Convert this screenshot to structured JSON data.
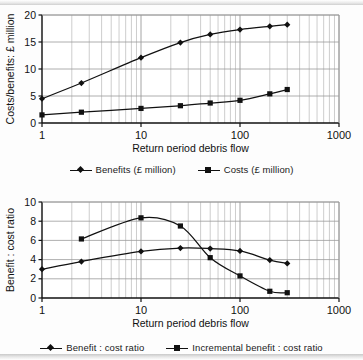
{
  "document": {
    "title": "Costs, benefits and benefit : cost ratios versus return period of debris flow"
  },
  "chart_data": [
    {
      "id": "top",
      "type": "line",
      "title": "",
      "xlabel": "Return period debris flow",
      "ylabel": "Costs/benefits: £ million",
      "xscale": "log",
      "xlim": [
        1,
        1000
      ],
      "ylim": [
        0,
        20
      ],
      "yticks": [
        0,
        5,
        10,
        15,
        20
      ],
      "xticks": [
        1,
        10,
        100,
        1000
      ],
      "xticklabels": [
        "1",
        "10",
        "100",
        "1000"
      ],
      "grid": "log-minor-vertical-and-major-horizontal",
      "legend_position": "below",
      "series": [
        {
          "name": "Benefits (£ million)",
          "marker": "diamond",
          "color": "#111111",
          "points": [
            {
              "x": 1,
              "y": 4.5
            },
            {
              "x": 2.5,
              "y": 7.4
            },
            {
              "x": 10,
              "y": 12.1
            },
            {
              "x": 25,
              "y": 14.9
            },
            {
              "x": 50,
              "y": 16.4
            },
            {
              "x": 100,
              "y": 17.3
            },
            {
              "x": 200,
              "y": 17.9
            },
            {
              "x": 300,
              "y": 18.2
            }
          ]
        },
        {
          "name": "Costs (£ million)",
          "marker": "square",
          "color": "#111111",
          "points": [
            {
              "x": 1,
              "y": 1.5
            },
            {
              "x": 2.5,
              "y": 2.0
            },
            {
              "x": 10,
              "y": 2.7
            },
            {
              "x": 25,
              "y": 3.2
            },
            {
              "x": 50,
              "y": 3.7
            },
            {
              "x": 100,
              "y": 4.2
            },
            {
              "x": 200,
              "y": 5.4
            },
            {
              "x": 300,
              "y": 6.2
            }
          ]
        }
      ]
    },
    {
      "id": "bottom",
      "type": "line",
      "title": "",
      "xlabel": "Return period debris flow",
      "ylabel": "Benefit : cost ratio",
      "xscale": "log",
      "xlim": [
        1,
        1000
      ],
      "ylim": [
        0,
        10
      ],
      "yticks": [
        0,
        2,
        4,
        6,
        8,
        10
      ],
      "xticks": [
        1,
        10,
        100,
        1000
      ],
      "xticklabels": [
        "1",
        "10",
        "100",
        "1000"
      ],
      "grid": "log-minor-vertical-and-major-horizontal",
      "legend_position": "below",
      "series": [
        {
          "name": "Benefit : cost ratio",
          "marker": "diamond",
          "color": "#111111",
          "points": [
            {
              "x": 1,
              "y": 3.0
            },
            {
              "x": 2.5,
              "y": 3.8
            },
            {
              "x": 10,
              "y": 4.85
            },
            {
              "x": 25,
              "y": 5.2
            },
            {
              "x": 50,
              "y": 5.15
            },
            {
              "x": 100,
              "y": 4.9
            },
            {
              "x": 200,
              "y": 3.95
            },
            {
              "x": 300,
              "y": 3.6
            }
          ]
        },
        {
          "name": "Incremental benefit : cost ratio",
          "marker": "square",
          "color": "#111111",
          "points": [
            {
              "x": 2.5,
              "y": 6.15
            },
            {
              "x": 10,
              "y": 8.35
            },
            {
              "x": 25,
              "y": 7.5
            },
            {
              "x": 50,
              "y": 4.2
            },
            {
              "x": 100,
              "y": 2.3
            },
            {
              "x": 200,
              "y": 0.7
            },
            {
              "x": 300,
              "y": 0.55
            }
          ]
        }
      ]
    }
  ],
  "top_chart": {
    "ylabel": "Costs/benefits: £ million",
    "xlabel": "Return period debris flow",
    "yticklabels": [
      "20",
      "15",
      "10",
      "5",
      "0"
    ],
    "xticklabels": [
      "1",
      "10",
      "100",
      "1000"
    ],
    "legend": [
      {
        "label": "Benefits (£ million)",
        "marker": "diamond"
      },
      {
        "label": "Costs (£ million)",
        "marker": "square"
      }
    ]
  },
  "bottom_chart": {
    "ylabel": "Benefit : cost ratio",
    "xlabel": "Return period debris flow",
    "yticklabels": [
      "10",
      "8",
      "6",
      "4",
      "2",
      "0"
    ],
    "xticklabels": [
      "1",
      "10",
      "100",
      "1000"
    ],
    "legend": [
      {
        "label": "Benefit : cost ratio",
        "marker": "diamond"
      },
      {
        "label": "Incremental benefit : cost ratio",
        "marker": "square"
      }
    ]
  },
  "style": {
    "ink": "#111111",
    "grid_major": "#9a9a9a",
    "grid_minor": "#b8b8b8",
    "paper": "#fdfdfd"
  }
}
